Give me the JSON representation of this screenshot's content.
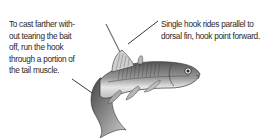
{
  "annotations": {
    "left": {
      "lines": [
        "To cast farther with-",
        "out tearing the bait",
        "off, run the hook",
        "through a portion of",
        "the tail muscle."
      ]
    },
    "right": {
      "lines": [
        "Single hook rides parallel to",
        "dorsal fin, hook point forward."
      ]
    }
  },
  "illustration": {
    "subject": "baitfish-minnow-with-hook",
    "colors": {
      "ink": "#2a2a2a",
      "shade": "#8a8a8a",
      "light": "#d8d8d8",
      "background": "#ffffff"
    }
  }
}
